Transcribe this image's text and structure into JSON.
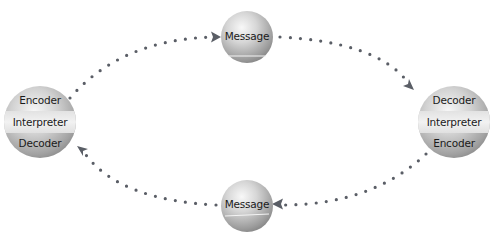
{
  "diagram": {
    "type": "communication-cycle",
    "colors": {
      "background": "#ffffff",
      "sphere_light": "#f2f2f2",
      "sphere_mid": "#c8c8c8",
      "sphere_dark": "#8e8e8e",
      "band_light": "#ececec",
      "connector": "#5a5e66",
      "text": "#1a1a1a"
    },
    "nodes": {
      "left": {
        "top": "Encoder",
        "middle": "Interpreter",
        "bottom": "Decoder"
      },
      "right": {
        "top": "Decoder",
        "middle": "Interpreter",
        "bottom": "Encoder"
      },
      "message_top": {
        "label": "Message"
      },
      "message_bottom": {
        "label": "Message"
      }
    },
    "edges": [
      {
        "from": "left",
        "to": "message_top",
        "style": "dotted",
        "arrow": "end"
      },
      {
        "from": "message_top",
        "to": "right",
        "style": "dotted",
        "arrow": "end"
      },
      {
        "from": "right",
        "to": "message_bottom",
        "style": "dotted",
        "arrow": "end"
      },
      {
        "from": "message_bottom",
        "to": "left",
        "style": "dotted",
        "arrow": "end"
      }
    ]
  }
}
